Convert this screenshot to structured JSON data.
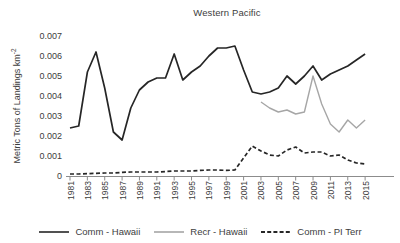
{
  "chart_data": {
    "type": "line",
    "title": "Western Pacific",
    "xlabel": "",
    "ylabel": "Metric Tons of Landings km⁻²",
    "ylabel_base": "Metric Tons of Landings km",
    "ylabel_sup": "-2",
    "ylim": [
      0,
      0.007
    ],
    "ytick_labels": [
      "0",
      "0.001",
      "0.002",
      "0.003",
      "0.004",
      "0.005",
      "0.006",
      "0.007"
    ],
    "xtick_labels": [
      "1981",
      "1983",
      "1985",
      "1987",
      "1989",
      "1991",
      "1993",
      "1995",
      "1997",
      "1999",
      "2001",
      "2003",
      "2005",
      "2007",
      "2009",
      "2011",
      "2013",
      "2015"
    ],
    "x": [
      1981,
      1982,
      1983,
      1984,
      1985,
      1986,
      1987,
      1988,
      1989,
      1990,
      1991,
      1992,
      1993,
      1994,
      1995,
      1996,
      1997,
      1998,
      1999,
      2000,
      2001,
      2002,
      2003,
      2004,
      2005,
      2006,
      2007,
      2008,
      2009,
      2010,
      2011,
      2012,
      2013,
      2014,
      2015
    ],
    "grid": false,
    "legend_position": "bottom",
    "axis_color": "#8c8c8c",
    "text_color": "#3d3d3d",
    "series": [
      {
        "name": "Comm - Hawaii",
        "color": "#262626",
        "style": "solid",
        "values": [
          0.0024,
          0.0025,
          0.0052,
          0.0062,
          0.0044,
          0.0022,
          0.0018,
          0.0034,
          0.0043,
          0.0047,
          0.0049,
          0.0049,
          0.0061,
          0.0048,
          0.0052,
          0.0055,
          0.006,
          0.0064,
          0.0064,
          0.0065,
          0.0053,
          0.0042,
          0.0041,
          0.0042,
          0.0044,
          0.005,
          0.0046,
          0.005,
          0.0055,
          0.0048,
          0.0051,
          0.0053,
          0.0055,
          0.0058,
          0.0061
        ]
      },
      {
        "name": "Recr - Hawaii",
        "color": "#a6a6a6",
        "style": "solid",
        "values": [
          null,
          null,
          null,
          null,
          null,
          null,
          null,
          null,
          null,
          null,
          null,
          null,
          null,
          null,
          null,
          null,
          null,
          null,
          null,
          null,
          null,
          null,
          0.0037,
          0.0034,
          0.0032,
          0.0033,
          0.0031,
          0.0032,
          0.005,
          0.0036,
          0.0026,
          0.0022,
          0.0028,
          0.0024,
          0.0028
        ]
      },
      {
        "name": "Comm - PI Terr",
        "color": "#262626",
        "style": "dashed",
        "values": [
          0.0001,
          0.0001,
          0.00012,
          0.00013,
          0.00015,
          0.00015,
          0.00018,
          0.0002,
          0.0002,
          0.0002,
          0.0002,
          0.00022,
          0.00025,
          0.00025,
          0.00025,
          0.00028,
          0.0003,
          0.0003,
          0.00028,
          0.0003,
          0.0009,
          0.0015,
          0.00125,
          0.00105,
          0.001,
          0.0013,
          0.00145,
          0.00115,
          0.0012,
          0.0012,
          0.001,
          0.00105,
          0.0008,
          0.00065,
          0.0006
        ]
      }
    ]
  }
}
